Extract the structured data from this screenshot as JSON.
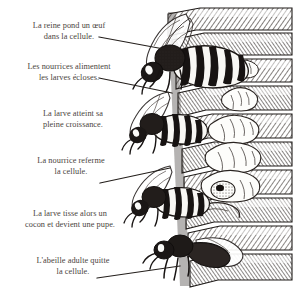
{
  "figure": {
    "language": "fr",
    "style": "pen-and-ink engraving",
    "background_color": "#ffffff",
    "text_color": "#4a4440",
    "ink_color": "#241f1c"
  },
  "captions": [
    {
      "id": "caption-queen-lays-egg",
      "line1": "La reine pond un œuf",
      "line2": "dans la cellule.",
      "has_leader": true
    },
    {
      "id": "caption-nurses-feed-larvae",
      "line1": "Les nourrices alimentent",
      "line2": "les larves écloses.",
      "has_leader": true
    },
    {
      "id": "caption-larva-full-growth",
      "line1": "La larve atteint sa",
      "line2": "pleine croissance.",
      "has_leader": false
    },
    {
      "id": "caption-nurse-seals-cell",
      "line1": "La nourrice referme",
      "line2": "la cellule.",
      "has_leader": true
    },
    {
      "id": "caption-larva-spins-cocoon",
      "line1": "La larve tisse alors un",
      "line2": "cocon et devient une pupe.",
      "has_leader": false
    },
    {
      "id": "caption-adult-bee-leaves",
      "line1": "L'abeille adulte quitte",
      "line2": "la cellule.",
      "has_leader": true
    }
  ],
  "leader_lines": [
    {
      "name": "leader-line-queen-lays-egg",
      "x1": 99,
      "y1": 37,
      "x2": 180,
      "y2": 52
    },
    {
      "name": "leader-line-nurses-feed",
      "x1": 99,
      "y1": 78,
      "x2": 172,
      "y2": 93
    },
    {
      "name": "leader-line-nurse-seals-cell",
      "x1": 100,
      "y1": 183,
      "x2": 170,
      "y2": 168
    },
    {
      "name": "leader-line-adult-leaves",
      "x1": 97,
      "y1": 278,
      "x2": 180,
      "y2": 266
    }
  ],
  "illustration": {
    "name": "honeycomb-cross-section",
    "elements": [
      {
        "name": "queen-bee",
        "label": "reine"
      },
      {
        "name": "nurse-bee-upper",
        "label": "nourrice"
      },
      {
        "name": "nurse-bee-middle",
        "label": "nourrice"
      },
      {
        "name": "nurse-bee-sealing",
        "label": "nourrice"
      },
      {
        "name": "emerging-adult-bee",
        "label": "abeille adulte"
      },
      {
        "name": "larva-small",
        "label": "larve"
      },
      {
        "name": "larva-growing",
        "label": "larve"
      },
      {
        "name": "larva-full-grown",
        "label": "larve"
      },
      {
        "name": "pupa-in-cocoon",
        "label": "pupe"
      },
      {
        "name": "comb-cells",
        "label": "cellules"
      }
    ]
  }
}
